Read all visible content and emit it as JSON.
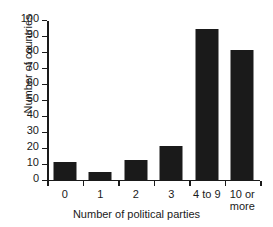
{
  "chart_data": {
    "type": "bar",
    "title": "",
    "xlabel": "Number of political parties",
    "ylabel": "Number of countries",
    "categories": [
      "0",
      "1",
      "2",
      "3",
      "4 to 9",
      "10 or\nmore"
    ],
    "values": [
      11,
      5,
      12,
      21,
      94,
      81
    ],
    "ylim": [
      0,
      100
    ],
    "yticks": [
      0,
      10,
      20,
      30,
      40,
      50,
      60,
      70,
      80,
      90,
      100
    ],
    "ytick_labels": [
      "0",
      "10",
      "20",
      "30",
      "40",
      "50",
      "60",
      "70",
      "80",
      "90",
      "100"
    ],
    "grid": false,
    "legend": false,
    "bar_color": "#1a1a1a",
    "axis_color": "#1a1a1a",
    "background_color": "#ffffff"
  }
}
